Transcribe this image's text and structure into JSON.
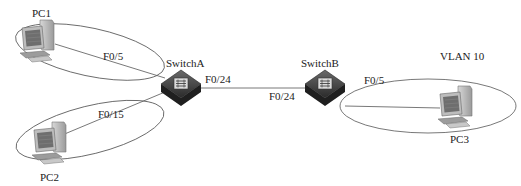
{
  "diagram": {
    "devices": {
      "pc1": {
        "label": "PC1"
      },
      "pc2": {
        "label": "PC2"
      },
      "pc3": {
        "label": "PC3"
      },
      "switch_a": {
        "label": "SwitchA"
      },
      "switch_b": {
        "label": "SwitchB"
      }
    },
    "links": {
      "pc1_switch_a": {
        "port": "F0/5"
      },
      "pc2_switch_a": {
        "port": "F0/15"
      },
      "switch_a_trunk": {
        "port": "F0/24"
      },
      "switch_b_trunk": {
        "port": "F0/24"
      },
      "switch_b_pc3": {
        "port": "F0/5"
      }
    },
    "groups": {
      "vlan_right": {
        "label": "VLAN 10"
      }
    },
    "colors": {
      "line": "#555555",
      "switch_dark": "#3a3a3a",
      "pc_gray": "#8a8a8a"
    }
  }
}
